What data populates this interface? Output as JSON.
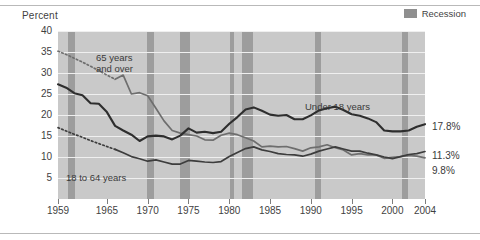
{
  "chart_data": {
    "type": "line",
    "title": "",
    "ylabel": "Percent",
    "xlabel": "",
    "ylim": [
      0,
      40
    ],
    "xlim": [
      1959,
      2004
    ],
    "grid": true,
    "legend_position": "top-right",
    "y_ticks": [
      "40",
      "35",
      "30",
      "25",
      "20",
      "15",
      "10",
      "5"
    ],
    "y_tick_values": [
      40,
      35,
      30,
      25,
      20,
      15,
      10,
      5
    ],
    "x_ticks": [
      "1959",
      "1965",
      "1970",
      "1975",
      "1980",
      "1985",
      "1990",
      "1995",
      "2000",
      "2004"
    ],
    "x_tick_values": [
      1959,
      1965,
      1970,
      1975,
      1980,
      1985,
      1990,
      1995,
      2000,
      2004
    ],
    "legend": [
      {
        "label": "Recession",
        "color": "#9d9d9d",
        "type": "band"
      }
    ],
    "series": [
      {
        "name": "65 years and over",
        "annotation": "65 years and over",
        "end_label": "9.8%",
        "color": "#6e6e6e",
        "dashed_before": 1966,
        "x": [
          1959,
          1960,
          1961,
          1962,
          1963,
          1964,
          1965,
          1966,
          1967,
          1968,
          1969,
          1970,
          1971,
          1972,
          1973,
          1974,
          1975,
          1976,
          1977,
          1978,
          1979,
          1980,
          1981,
          1982,
          1983,
          1984,
          1985,
          1986,
          1987,
          1988,
          1989,
          1990,
          1991,
          1992,
          1993,
          1994,
          1995,
          1996,
          1997,
          1998,
          1999,
          2000,
          2001,
          2002,
          2003,
          2004
        ],
        "values": [
          35.2,
          34.4,
          33.5,
          32.6,
          31.6,
          30.6,
          29.5,
          28.5,
          29.5,
          25.0,
          25.3,
          24.6,
          21.6,
          18.6,
          16.3,
          15.7,
          15.3,
          15.0,
          14.1,
          14.0,
          15.2,
          15.7,
          15.3,
          14.6,
          13.8,
          12.4,
          12.6,
          12.4,
          12.5,
          12.0,
          11.4,
          12.2,
          12.4,
          12.9,
          12.2,
          11.7,
          10.5,
          10.8,
          10.5,
          10.5,
          9.7,
          9.9,
          10.1,
          10.4,
          10.2,
          9.8
        ]
      },
      {
        "name": "Under 18 years",
        "annotation": "Under 18 years",
        "end_label": "17.8%",
        "color": "#2e2e2e",
        "x": [
          1959,
          1960,
          1961,
          1962,
          1963,
          1964,
          1965,
          1966,
          1967,
          1968,
          1969,
          1970,
          1971,
          1972,
          1973,
          1974,
          1975,
          1976,
          1977,
          1978,
          1979,
          1980,
          1981,
          1982,
          1983,
          1984,
          1985,
          1986,
          1987,
          1988,
          1989,
          1990,
          1991,
          1992,
          1993,
          1994,
          1995,
          1996,
          1997,
          1998,
          1999,
          2000,
          2001,
          2002,
          2003,
          2004
        ],
        "values": [
          27.3,
          26.5,
          25.2,
          24.7,
          22.8,
          22.7,
          20.7,
          17.4,
          16.3,
          15.3,
          13.8,
          14.9,
          15.1,
          14.9,
          14.2,
          15.1,
          16.8,
          15.8,
          16.0,
          15.7,
          16.0,
          17.9,
          19.5,
          21.3,
          21.8,
          21.0,
          20.1,
          19.8,
          20.0,
          19.0,
          19.0,
          19.9,
          21.1,
          21.6,
          22.0,
          21.2,
          20.2,
          19.8,
          19.2,
          18.3,
          16.3,
          16.1,
          16.1,
          16.3,
          17.2,
          17.8
        ]
      },
      {
        "name": "18 to 64 years",
        "annotation": "18 to 64 years",
        "end_label": "11.3%",
        "color": "#3d3d3d",
        "dashed_before": 1966,
        "x": [
          1959,
          1960,
          1961,
          1962,
          1963,
          1964,
          1965,
          1966,
          1967,
          1968,
          1969,
          1970,
          1971,
          1972,
          1973,
          1974,
          1975,
          1976,
          1977,
          1978,
          1979,
          1980,
          1981,
          1982,
          1983,
          1984,
          1985,
          1986,
          1987,
          1988,
          1989,
          1990,
          1991,
          1992,
          1993,
          1994,
          1995,
          1996,
          1997,
          1998,
          1999,
          2000,
          2001,
          2002,
          2003,
          2004
        ],
        "values": [
          17.0,
          16.2,
          15.4,
          14.7,
          13.9,
          13.2,
          12.5,
          11.8,
          11.0,
          10.1,
          9.6,
          9.0,
          9.3,
          8.8,
          8.3,
          8.3,
          9.2,
          9.0,
          8.8,
          8.7,
          8.9,
          10.1,
          11.1,
          12.0,
          12.4,
          11.7,
          11.3,
          10.8,
          10.6,
          10.5,
          10.2,
          10.7,
          11.4,
          11.9,
          12.4,
          11.9,
          11.4,
          11.4,
          10.9,
          10.5,
          10.0,
          9.6,
          10.1,
          10.6,
          10.8,
          11.3
        ]
      }
    ],
    "recession_bands": [
      {
        "label": "1960-1961",
        "start": 1960.2,
        "end": 1961.1
      },
      {
        "label": "1969-1970",
        "start": 1969.9,
        "end": 1970.8
      },
      {
        "label": "1973-1975",
        "start": 1973.9,
        "end": 1975.2
      },
      {
        "label": "1980",
        "start": 1980.1,
        "end": 1980.6
      },
      {
        "label": "1981-1982",
        "start": 1981.5,
        "end": 1982.9
      },
      {
        "label": "1990-1991",
        "start": 1990.5,
        "end": 1991.2
      },
      {
        "label": "2001",
        "start": 2001.2,
        "end": 2001.9
      }
    ]
  },
  "annotations": {
    "percent_label": "Percent"
  }
}
